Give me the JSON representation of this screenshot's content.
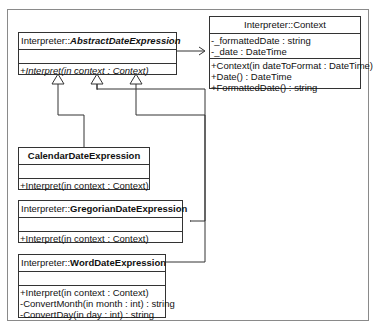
{
  "diagram": {
    "type": "uml-class",
    "classes": [
      {
        "id": "abstract",
        "namespace": "Interpreter::",
        "name": "AbstractDateExpression",
        "abstract": true,
        "attributes": [],
        "operations": [
          "+Interpret(in context : Context)"
        ]
      },
      {
        "id": "context",
        "namespace": "Interpreter::",
        "name": "Context",
        "abstract": false,
        "attributes": [
          "-_formattedDate : string",
          "-_date : DateTime"
        ],
        "operations": [
          "+Context(in dateToFormat : DateTime)",
          "+Date() : DateTime",
          "+FormattedDate() : string"
        ]
      },
      {
        "id": "calendar",
        "namespace": "",
        "name": "CalendarDateExpression",
        "abstract": false,
        "attributes": [],
        "operations": [
          "+Interpret(in context : Context)"
        ]
      },
      {
        "id": "gregorian",
        "namespace": "Interpreter::",
        "name": "GregorianDateExpression",
        "abstract": false,
        "attributes": [],
        "operations": [
          "+Interpret(in context : Context)"
        ]
      },
      {
        "id": "word",
        "namespace": "Interpreter::",
        "name": "WordDateExpression",
        "abstract": false,
        "attributes": [],
        "operations": [
          "+Interpret(in context : Context)",
          "-ConvertMonth(in month : int) : string",
          "-ConvertDay(in day : int) : string"
        ]
      }
    ],
    "relations": [
      {
        "from": "abstract",
        "to": "context",
        "kind": "association"
      },
      {
        "from": "calendar",
        "to": "abstract",
        "kind": "generalization"
      },
      {
        "from": "gregorian",
        "to": "abstract",
        "kind": "generalization"
      },
      {
        "from": "word",
        "to": "abstract",
        "kind": "generalization"
      }
    ]
  }
}
